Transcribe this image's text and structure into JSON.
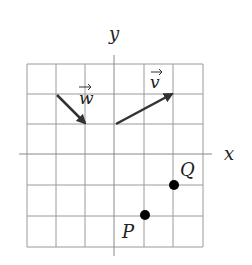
{
  "diagram": {
    "type": "coordinate-grid",
    "grid": {
      "x_min": -3,
      "x_max": 3,
      "y_min": -3,
      "y_max": 3,
      "step": 1
    },
    "axes": {
      "x_label": "x",
      "y_label": "y"
    },
    "vectors": [
      {
        "name": "w",
        "label": "w",
        "from": [
          -2,
          2
        ],
        "to": [
          -1,
          1
        ]
      },
      {
        "name": "v",
        "label": "v",
        "from": [
          0,
          1
        ],
        "to": [
          2,
          2
        ]
      }
    ],
    "points": [
      {
        "name": "P",
        "label": "P",
        "at": [
          1,
          -2
        ]
      },
      {
        "name": "Q",
        "label": "Q",
        "at": [
          2,
          -1
        ]
      }
    ],
    "colors": {
      "grid": "#9a9a9a",
      "axis": "#888888",
      "vector": "#333333",
      "point": "#000000"
    }
  }
}
